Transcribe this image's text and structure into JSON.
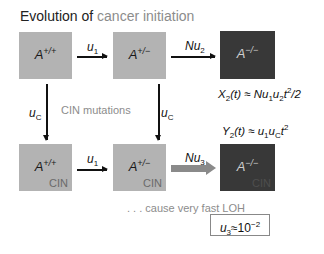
{
  "title": {
    "part1": "Evolution of ",
    "part2": "cancer initiation"
  },
  "colors": {
    "light_box": "#b3b3b3",
    "dark_box": "#383838",
    "accent_gray": "#8c8c8c",
    "fat_arrow": "#8a8a8a"
  },
  "top_row": [
    {
      "base": "A",
      "sup": "+/+"
    },
    {
      "base": "A",
      "sup": "+/−"
    },
    {
      "base": "A",
      "sup": "−/−"
    }
  ],
  "bottom_row": [
    {
      "base": "A",
      "sup": "+/+",
      "tag": "CIN"
    },
    {
      "base": "A",
      "sup": "+/−",
      "tag": "CIN"
    },
    {
      "base": "A",
      "sup": "−/−",
      "tag": "CIN"
    }
  ],
  "rates": {
    "u1_base": "u",
    "u1_sub": "1",
    "Nu2_base": "Nu",
    "Nu2_sub": "2",
    "uc_base": "u",
    "uc_sub": "C",
    "Nu3_base": "Nu",
    "Nu3_sub": "3"
  },
  "middle_label": "CIN mutations",
  "equations": {
    "x2": {
      "lhs": "X",
      "lhs_sub": "2",
      "lhs_rest": "(t) ≈ Nu",
      "s1": "1",
      "m": "u",
      "s2": "2",
      "t": "t",
      "p": "2",
      "tail": "/2"
    },
    "y2": {
      "lhs": "Y",
      "lhs_sub": "2",
      "lhs_rest": "(t) ≈ u",
      "s1": "1",
      "m": "u",
      "s2": "C",
      "t": "t",
      "p": "2"
    }
  },
  "note": ". . . cause very fast LOH",
  "u3_box": {
    "base": "u",
    "sub": "3",
    "approx": "≈10",
    "exp": "−2"
  }
}
